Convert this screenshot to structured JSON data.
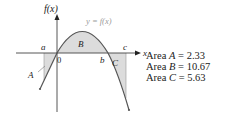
{
  "figure": {
    "y_axis_label": "f(x)",
    "x_axis_label": "x",
    "curve_label": "y = f(x)",
    "origin_label": "0",
    "point_labels": {
      "a": "a",
      "b": "b",
      "c": "c"
    },
    "region_labels": {
      "A": "A",
      "B": "B",
      "C": "C"
    },
    "colors": {
      "curve": "#555555",
      "axis": "#444444",
      "shade": "#dcdcdc",
      "curve_label": "#9a9a9a"
    }
  },
  "legend": {
    "items": [
      {
        "prefix": "Area ",
        "name": "A",
        "eq": " = ",
        "value": "2.33"
      },
      {
        "prefix": "Area ",
        "name": "B",
        "eq": " = ",
        "value": "10.67"
      },
      {
        "prefix": "Area ",
        "name": "C",
        "eq": " = ",
        "value": "5.63"
      }
    ]
  }
}
